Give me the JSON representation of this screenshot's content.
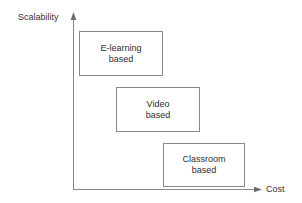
{
  "diagram": {
    "type": "positioning-matrix",
    "background_color": "#ffffff",
    "stroke_color": "#8a8a8a",
    "text_color": "#2e2e2e",
    "axes": {
      "y": {
        "label": "Scalability",
        "orientation": "vertical",
        "arrow": "up",
        "arrow_icon": "arrow-up-icon"
      },
      "x": {
        "label": "Cost",
        "orientation": "horizontal",
        "arrow": "right",
        "arrow_icon": "arrow-right-icon"
      }
    },
    "boxes": [
      {
        "id": "e-learning",
        "lines": [
          "E-learning",
          "based"
        ],
        "line1": "E-learning",
        "line2": "based",
        "rank_scalability": "high",
        "rank_cost": "low",
        "x": 79,
        "y": 31,
        "width": 84,
        "height": 45
      },
      {
        "id": "video",
        "lines": [
          "Video",
          "based"
        ],
        "line1": "Video",
        "line2": "based",
        "rank_scalability": "medium",
        "rank_cost": "medium",
        "x": 116,
        "y": 87,
        "width": 84,
        "height": 45
      },
      {
        "id": "classroom",
        "lines": [
          "Classroom",
          "based"
        ],
        "line1": "Classroom",
        "line2": "based",
        "rank_scalability": "low",
        "rank_cost": "high",
        "x": 163,
        "y": 143,
        "width": 82,
        "height": 44
      }
    ]
  }
}
